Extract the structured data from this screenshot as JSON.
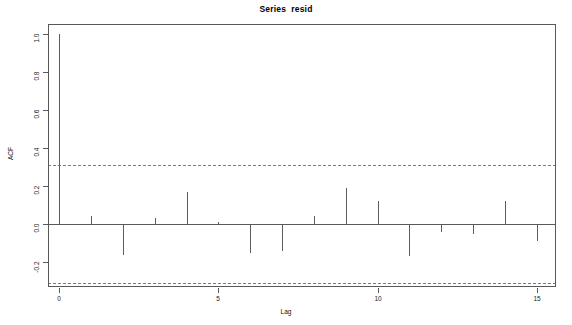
{
  "chart_data": {
    "type": "bar",
    "title": "Series  resid",
    "xlabel": "Lag",
    "ylabel": "ACF",
    "x": [
      0,
      1,
      2,
      3,
      4,
      5,
      6,
      7,
      8,
      9,
      10,
      11,
      12,
      13,
      14,
      15
    ],
    "values": [
      1.0,
      0.04,
      -0.16,
      0.03,
      0.17,
      0.01,
      -0.15,
      -0.14,
      0.04,
      0.19,
      0.12,
      -0.17,
      -0.04,
      -0.05,
      0.12,
      -0.09
    ],
    "categories": [
      "0",
      "1",
      "2",
      "3",
      "4",
      "5",
      "6",
      "7",
      "8",
      "9",
      "10",
      "11",
      "12",
      "13",
      "14",
      "15"
    ],
    "xlim": [
      -0.35,
      15.6
    ],
    "ylim": [
      -0.33,
      1.05
    ],
    "xticks": [
      0,
      5,
      10,
      15
    ],
    "xticklabels": [
      "0",
      "5",
      "10",
      "15"
    ],
    "yticks": [
      -0.2,
      0.0,
      0.2,
      0.4,
      0.6,
      0.8,
      1.0
    ],
    "yticklabels": [
      "-0.2",
      "0.0",
      "0.2",
      "0.4",
      "0.6",
      "0.8",
      "1.0"
    ],
    "confidence_bands": [
      0.31,
      -0.31
    ],
    "confidence_style": "dashed",
    "grid": false,
    "legend": null,
    "zero_line": 0.0,
    "series_color": "#5c5c5c",
    "band_color": "#7a7a7a",
    "axis_color": "#585858"
  },
  "figure": {
    "background": "#ffffff",
    "plot_left": 48,
    "plot_top": 24,
    "plot_width": 508,
    "plot_height": 263
  }
}
